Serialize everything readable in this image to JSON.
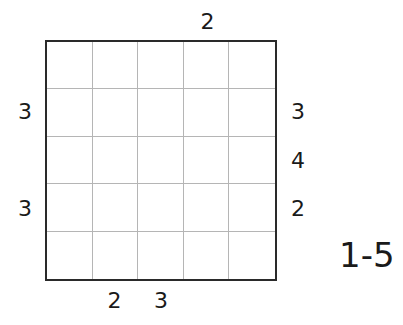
{
  "puzzle": {
    "size": 5,
    "range_label": "1-5",
    "clues": {
      "top": [
        "",
        "",
        "",
        "2",
        ""
      ],
      "bottom": [
        "",
        "2",
        "3",
        "",
        ""
      ],
      "left": [
        "",
        "3",
        "",
        "3",
        ""
      ],
      "right": [
        "",
        "3",
        "4",
        "2",
        ""
      ]
    },
    "cells": [
      [
        "",
        "",
        "",
        "",
        ""
      ],
      [
        "",
        "",
        "",
        "",
        ""
      ],
      [
        "",
        "",
        "",
        "",
        ""
      ],
      [
        "",
        "",
        "",
        "",
        ""
      ],
      [
        "",
        "",
        "",
        "",
        ""
      ]
    ]
  }
}
